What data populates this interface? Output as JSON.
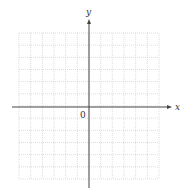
{
  "diagram": {
    "type": "coordinate-grid",
    "x_axis_label": "x",
    "y_axis_label": "y",
    "origin_label": "0",
    "grid": {
      "columns": 12,
      "rows": 12,
      "left": 19,
      "top": 33,
      "right": 159,
      "bottom": 179,
      "line_color": "#cfcfcf",
      "line_style": "dotted"
    },
    "axes": {
      "origin_px": [
        89,
        107
      ],
      "x_start": 12,
      "x_end": 172,
      "y_start": 188,
      "y_end": 19,
      "color": "#444444"
    }
  }
}
